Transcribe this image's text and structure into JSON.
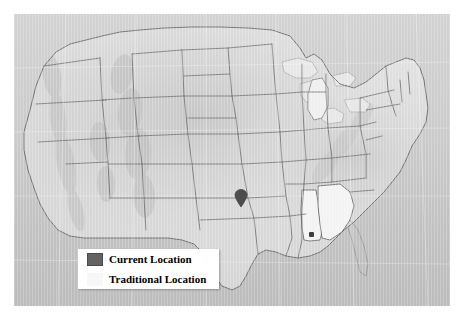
{
  "figure": {
    "type": "map",
    "region": "Contiguous United States",
    "style": "grayscale shaded relief with state boundaries",
    "background_color": "#ffffff",
    "map_background_color": "#c9c9c9",
    "land_color": "#d8d8d8",
    "border_color": "#5a5a5a",
    "highlight_color": "#f2f2f2"
  },
  "legend": {
    "background_color": "#ffffff",
    "items": [
      {
        "label": "Current Location",
        "swatch_color": "#636363",
        "swatch_border": "#4a4a4a",
        "marker": "map-pin"
      },
      {
        "label": "Traditional Location",
        "swatch_color": "#f7f7f7",
        "swatch_border": "#f7f7f7",
        "marker": "shaded-state"
      }
    ]
  },
  "markers": {
    "current_location": {
      "name": "map-pin-marker",
      "state": "Oklahoma",
      "color": "#4d4d4d"
    },
    "traditional_location_point": {
      "name": "point-marker",
      "state": "Alabama",
      "color": "#3f3f3f"
    }
  },
  "highlighted_states": [
    {
      "name": "Alabama",
      "fill": "#f2f2f2"
    },
    {
      "name": "Georgia",
      "fill": "#f2f2f2"
    }
  ]
}
